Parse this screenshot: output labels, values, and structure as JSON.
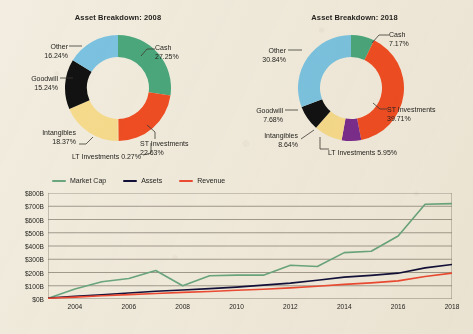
{
  "theme": {
    "background": "#f2ede0",
    "text": "#262420",
    "axis": "#6b6558",
    "grid": "#8d8678"
  },
  "palette": {
    "cash": "#4ba87d",
    "st_investments": "#f04e23",
    "lt_investments_2008": "#f7dc8e",
    "lt_investments_2018": "#7b2d8e",
    "intangibles": "#f7dc8e",
    "goodwill": "#121212",
    "other": "#7cc4e3",
    "market_cap": "#6aa77f",
    "assets": "#12103a",
    "revenue": "#ee4b33"
  },
  "donuts": [
    {
      "id": "2008",
      "title": "Asset Breakdown: 2008",
      "slices": [
        {
          "name": "Cash",
          "label": "Cash",
          "pct": "27.25%",
          "value": 27.25,
          "color": "#4ba87d"
        },
        {
          "name": "ST Investments",
          "label": "ST Investments",
          "pct": "22.63%",
          "value": 22.63,
          "color": "#f04e23"
        },
        {
          "name": "LT Investments",
          "label": "LT Investments",
          "pct": "0.27%",
          "value": 0.27,
          "color": "#f7dc8e"
        },
        {
          "name": "Intangibles",
          "label": "Intangibles",
          "pct": "18.37%",
          "value": 18.37,
          "color": "#f7dc8e"
        },
        {
          "name": "Goodwill",
          "label": "Goodwill",
          "pct": "15.24%",
          "value": 15.24,
          "color": "#121212"
        },
        {
          "name": "Other",
          "label": "Other",
          "pct": "16.24%",
          "value": 16.24,
          "color": "#7cc4e3"
        }
      ]
    },
    {
      "id": "2018",
      "title": "Asset Breakdown: 2018",
      "slices": [
        {
          "name": "Cash",
          "label": "Cash",
          "pct": "7.17%",
          "value": 7.17,
          "color": "#4ba87d"
        },
        {
          "name": "ST Investments",
          "label": "ST Investments",
          "pct": "39.71%",
          "value": 39.71,
          "color": "#f04e23"
        },
        {
          "name": "LT Investments",
          "label": "LT Investments",
          "pct": "5.95%",
          "value": 5.95,
          "color": "#7b2d8e"
        },
        {
          "name": "Intangibles",
          "label": "Intangibles",
          "pct": "8.64%",
          "value": 8.64,
          "color": "#f7dc8e"
        },
        {
          "name": "Goodwill",
          "label": "Goodwill",
          "pct": "7.68%",
          "value": 7.68,
          "color": "#121212"
        },
        {
          "name": "Other",
          "label": "Other",
          "pct": "30.84%",
          "value": 30.84,
          "color": "#7cc4e3"
        }
      ]
    }
  ],
  "chart_data": [
    {
      "type": "pie",
      "title": "Asset Breakdown: 2008",
      "labels": [
        "Cash",
        "ST Investments",
        "LT Investments",
        "Intangibles",
        "Goodwill",
        "Other"
      ],
      "values": [
        27.25,
        22.63,
        0.27,
        18.37,
        15.24,
        16.24
      ],
      "units": "percent",
      "legend": "labels-with-leader-lines"
    },
    {
      "type": "pie",
      "title": "Asset Breakdown: 2018",
      "labels": [
        "Cash",
        "ST Investments",
        "LT Investments",
        "Intangibles",
        "Goodwill",
        "Other"
      ],
      "values": [
        7.17,
        39.71,
        5.95,
        8.64,
        7.68,
        30.84
      ],
      "units": "percent",
      "legend": "labels-with-leader-lines"
    },
    {
      "type": "line",
      "title": "",
      "xlabel": "",
      "ylabel": "",
      "x": [
        2003,
        2004,
        2005,
        2006,
        2007,
        2008,
        2009,
        2010,
        2011,
        2012,
        2013,
        2014,
        2015,
        2016,
        2017,
        2018
      ],
      "xticks": [
        "2004",
        "2006",
        "2008",
        "2010",
        "2012",
        "2014",
        "2016",
        "2018"
      ],
      "yticks": [
        "$0B",
        "$100B",
        "$200B",
        "$300B",
        "$400B",
        "$500B",
        "$600B",
        "$700B",
        "$800B"
      ],
      "ylim": [
        0,
        800
      ],
      "xlim": [
        2003,
        2018
      ],
      "grid": true,
      "legend_position": "top-left",
      "series": [
        {
          "name": "Market Cap",
          "color": "#6aa77f",
          "values": [
            5,
            75,
            130,
            155,
            215,
            100,
            175,
            180,
            180,
            255,
            245,
            350,
            360,
            475,
            715,
            720
          ]
        },
        {
          "name": "Assets",
          "color": "#12103a",
          "values": [
            8,
            20,
            32,
            45,
            58,
            68,
            78,
            90,
            105,
            120,
            142,
            165,
            178,
            195,
            235,
            260
          ]
        },
        {
          "name": "Revenue",
          "color": "#ee4b33",
          "values": [
            6,
            14,
            24,
            33,
            42,
            50,
            57,
            66,
            74,
            84,
            96,
            110,
            122,
            137,
            170,
            195
          ]
        }
      ]
    }
  ],
  "legend": {
    "items": [
      {
        "label": "Market Cap",
        "color": "#6aa77f"
      },
      {
        "label": "Assets",
        "color": "#12103a"
      },
      {
        "label": "Revenue",
        "color": "#ee4b33"
      }
    ]
  }
}
